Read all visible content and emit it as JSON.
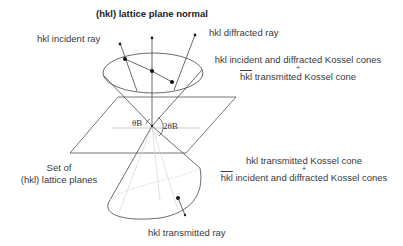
{
  "diagram": {
    "labels": {
      "plane_normal": "(hkl) lattice plane normal",
      "incident_ray": "hkl incident ray",
      "diffracted_ray": "hkl diffracted ray",
      "upper_cone_line1": "hkl incident and diffracted Kossel cones",
      "upper_cone_plus": "+",
      "upper_cone_line2_prefix": "hkl",
      "upper_cone_line2_suffix": " transmitted Kossel cone",
      "lower_cone_line1": "hkl transmitted Kossel cone",
      "lower_cone_plus": "+",
      "lower_cone_line2_prefix": "hkl",
      "lower_cone_line2_suffix": " incident and diffracted Kossel cones",
      "planes_line1": "Set of",
      "planes_line2": "(hkl) lattice planes",
      "transmitted_ray": "hkl transmitted ray",
      "theta_b": "θB",
      "two_theta_b": "2θB"
    },
    "colors": {
      "line": "#444444",
      "light_line": "#bbbbbb",
      "dot": "#111111"
    }
  }
}
